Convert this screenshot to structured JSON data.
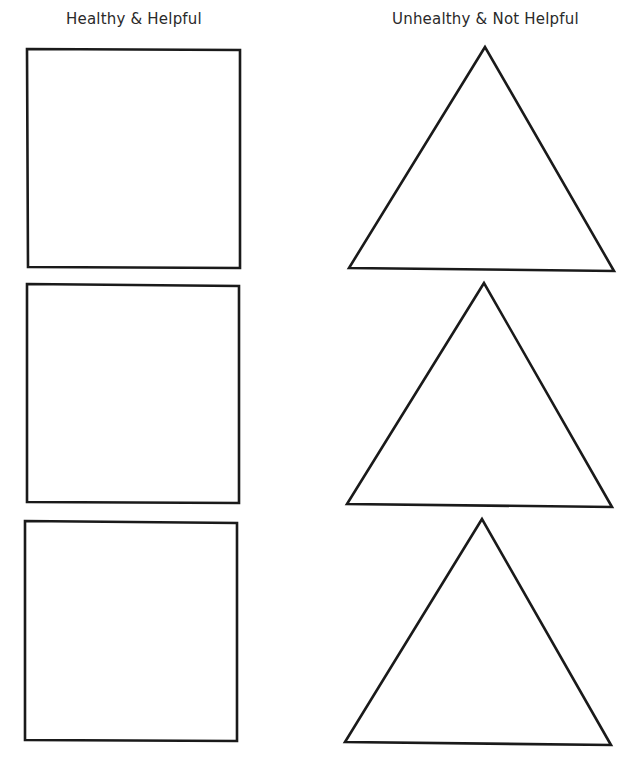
{
  "worksheet": {
    "columns": [
      {
        "heading": "Healthy & Helpful",
        "shape": "square",
        "count": 3
      },
      {
        "heading": "Unhealthy & Not Helpful",
        "shape": "triangle",
        "count": 3
      }
    ],
    "colors": {
      "stroke": "#1a1a1a",
      "background": "#ffffff",
      "text": "#2a2a2a"
    }
  }
}
